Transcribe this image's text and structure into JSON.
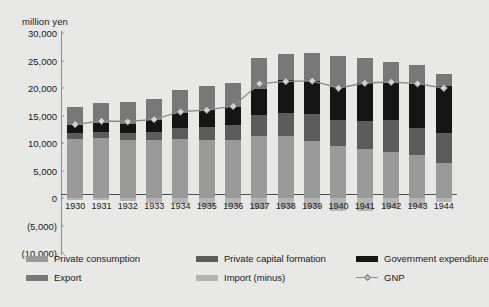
{
  "chart_data": {
    "type": "bar",
    "title": "",
    "subtitle": "",
    "xlabel": "",
    "ylabel": "million yen",
    "unit_label": "million yen",
    "stacked": true,
    "grid": false,
    "legend_position": "bottom",
    "ylim": [
      -10000,
      30000
    ],
    "ytick_step": 5000,
    "ytick_labels": [
      "30,000",
      "25,000",
      "20,000",
      "15,000",
      "10,000",
      "5,000",
      "0",
      "(5,000)",
      "(10,000)"
    ],
    "ytick_values": [
      30000,
      25000,
      20000,
      15000,
      10000,
      5000,
      0,
      -5000,
      -10000
    ],
    "categories": [
      "1930",
      "1931",
      "1932",
      "1933",
      "1934",
      "1935",
      "1936",
      "1937",
      "1938",
      "1939",
      "1940",
      "1941",
      "1942",
      "1943",
      "1944"
    ],
    "series": [
      {
        "name": "Private consumption",
        "color": "#9a9a9a",
        "values": [
          10800,
          10900,
          10500,
          10500,
          10700,
          10600,
          10500,
          11200,
          11200,
          10400,
          9400,
          8900,
          8400,
          7800,
          6400
        ]
      },
      {
        "name": "Private capital formation",
        "color": "#5c5c5c",
        "values": [
          1100,
          1150,
          1300,
          1500,
          2000,
          2400,
          2700,
          3900,
          4200,
          4900,
          4700,
          5100,
          5700,
          5000,
          5500
        ]
      },
      {
        "name": "Government expenditure",
        "color": "#151515",
        "values": [
          1400,
          1500,
          1700,
          2100,
          2800,
          3000,
          3400,
          4700,
          6100,
          6000,
          6000,
          6900,
          7000,
          7900,
          8400
        ]
      },
      {
        "name": "Export",
        "color": "#787878",
        "values": [
          3200,
          3700,
          4000,
          3900,
          4200,
          4300,
          4400,
          5600,
          4700,
          5000,
          5700,
          4600,
          3600,
          3400,
          2200
        ]
      },
      {
        "name": "Import (minus)",
        "color": "#b4b4b4",
        "values": [
          -300,
          -400,
          -600,
          -900,
          -1100,
          -1600,
          -1700,
          -2000,
          -1900,
          -1900,
          -2400,
          -2300,
          -1800,
          -1700,
          -700
        ]
      }
    ],
    "line_series": {
      "name": "GNP",
      "color": "#8a8a8a",
      "marker": "diamond",
      "values": [
        13400,
        14000,
        13900,
        14300,
        15700,
        16000,
        16700,
        20800,
        21200,
        21300,
        20000,
        20900,
        21100,
        20800,
        20000
      ]
    }
  },
  "legend": {
    "items": [
      {
        "label": "Private consumption",
        "kind": "swatch",
        "color": "#9a9a9a"
      },
      {
        "label": "Private capital formation",
        "kind": "swatch",
        "color": "#5c5c5c"
      },
      {
        "label": "Government expenditure",
        "kind": "swatch",
        "color": "#151515"
      },
      {
        "label": "Export",
        "kind": "swatch",
        "color": "#787878"
      },
      {
        "label": "Import (minus)",
        "kind": "swatch",
        "color": "#b4b4b4"
      },
      {
        "label": "GNP",
        "kind": "line",
        "color": "#8a8a8a"
      }
    ]
  }
}
